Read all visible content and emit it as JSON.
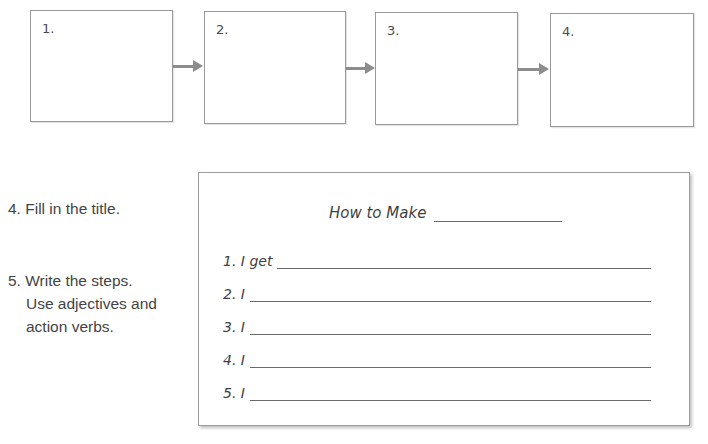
{
  "flow": {
    "boxes": [
      {
        "label": "1."
      },
      {
        "label": "2."
      },
      {
        "label": "3."
      },
      {
        "label": "4."
      }
    ],
    "arrow_color": "#8c8c8c"
  },
  "instructions": {
    "step4": "4. Fill in the title.",
    "step5_line1": "5. Write the steps.",
    "step5_line2": "Use adjectives and",
    "step5_line3": "action verbs."
  },
  "card": {
    "title": "How to Make",
    "title_value": "",
    "lines": [
      {
        "label": "1. I get",
        "value": ""
      },
      {
        "label": "2. I",
        "value": ""
      },
      {
        "label": "3. I",
        "value": ""
      },
      {
        "label": "4. I",
        "value": ""
      },
      {
        "label": "5. I",
        "value": ""
      }
    ]
  }
}
